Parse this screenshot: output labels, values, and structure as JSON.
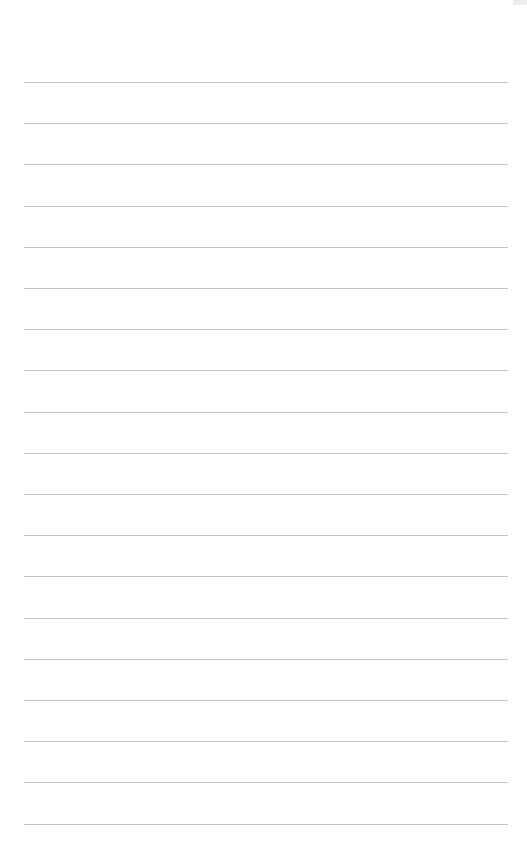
{
  "page": {
    "type": "lined-paper",
    "line_count": 19,
    "first_line_y": 82,
    "line_spacing": 41.2,
    "line_left": 24,
    "line_right": 508,
    "colors": {
      "background": "#ffffff",
      "line": "#c4c4c4"
    }
  }
}
